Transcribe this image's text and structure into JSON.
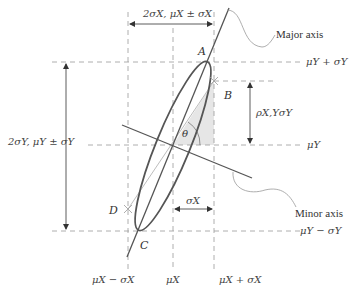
{
  "diagram": {
    "type": "bivariate-normal-ellipse",
    "colors": {
      "ellipse": "#555555",
      "axes": "#555555",
      "dashed": "#999999",
      "shade": "#e6e6e6",
      "text": "#444444"
    },
    "top_dimension": "2σX, μX ± σX",
    "left_dimension": "2σY, μY ± σY",
    "right_labels": {
      "mu_y_plus": "μY + σY",
      "mu_y": "μY",
      "mu_y_minus": "μY − σY"
    },
    "bottom_labels": {
      "mu_x_minus": "μX − σX",
      "mu_x": "μX",
      "mu_x_plus": "μX + σX"
    },
    "rho_label": "ρX,YσY",
    "sigma_x_label": "σX",
    "theta_label": "θ",
    "points": {
      "A": "A",
      "B": "B",
      "C": "C",
      "D": "D"
    },
    "callouts": {
      "major_axis": "Major axis",
      "minor_axis": "Minor axis"
    }
  }
}
